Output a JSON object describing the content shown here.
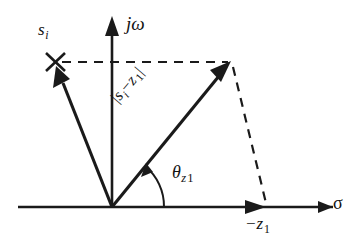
{
  "figure": {
    "type": "s-plane pole-zero vector diagram",
    "background_color": "#ffffff",
    "ink_color": "#1a1a1a",
    "axes": {
      "real": {
        "label": "σ",
        "label_name": "sigma",
        "direction": "right",
        "has_arrow": true
      },
      "imaginary": {
        "label": "jω",
        "label_name": "j-omega",
        "direction": "up",
        "has_arrow": true
      }
    },
    "labels": {
      "pole_point": "s",
      "pole_point_sub": "i",
      "zero_point_prefix": "−z",
      "zero_point_sub": "1",
      "angle": "θ",
      "angle_sub_z": "z",
      "angle_sub_num": "1",
      "magnitude_open": "|",
      "magnitude_s": "s",
      "magnitude_s_sub": "i",
      "magnitude_minus": "−",
      "magnitude_z": "z",
      "magnitude_z_sub": "1",
      "magnitude_close": "|"
    },
    "markers": {
      "pole_marker_glyph": "×",
      "pole_marker_name": "cross-mark"
    },
    "geometry": {
      "origin": [
        112,
        207
      ],
      "pole_si": [
        55,
        62
      ],
      "vector_tip": [
        230,
        62
      ],
      "zero_negz1": [
        265,
        207
      ],
      "angle_arc_radius": 52,
      "angle_degrees": 50
    }
  }
}
